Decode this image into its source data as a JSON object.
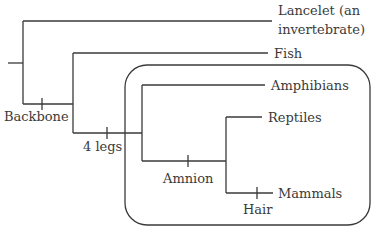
{
  "colors": {
    "line": "#3a3a3a",
    "text": "#3a3a3a",
    "background": "#ffffff"
  },
  "taxa": {
    "lancelet_line1": "Lancelet (an",
    "lancelet_line2": "invertebrate)",
    "fish": "Fish",
    "amphibians": "Amphibians",
    "reptiles": "Reptiles",
    "mammals": "Mammals"
  },
  "traits": {
    "backbone": "Backbone",
    "four_legs": "4 legs",
    "amnion": "Amnion",
    "hair": "Hair"
  },
  "groups": [
    {
      "name": "tetrapod-clade-box",
      "members": [
        "Amphibians",
        "Reptiles",
        "Mammals"
      ]
    }
  ]
}
